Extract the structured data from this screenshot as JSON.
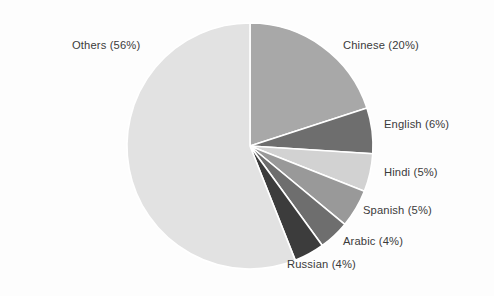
{
  "chart_data": {
    "type": "pie",
    "title": "",
    "subtitle": "",
    "xlabel": "",
    "ylabel": "",
    "grid": false,
    "legend_position": "none",
    "label_format": "{name} ({value}%)",
    "background_color": "#fdfdfd",
    "separator_color": "#ffffff",
    "label_text_color": "#3b3b3b",
    "center": {
      "x": 250,
      "y": 146
    },
    "radius": 123,
    "start_angle_deg": 0,
    "direction": "clockwise",
    "categories": [
      "Chinese",
      "English",
      "Hindi",
      "Spanish",
      "Arabic",
      "Russian",
      "Others"
    ],
    "values": [
      20,
      6,
      5,
      5,
      4,
      4,
      56
    ],
    "unit": "%",
    "slices": [
      {
        "name": "Chinese",
        "value": 20,
        "label": "Chinese (20%)",
        "color": "#a8a8a8"
      },
      {
        "name": "English",
        "value": 6,
        "label": "English (6%)",
        "color": "#6e6e6e"
      },
      {
        "name": "Hindi",
        "value": 5,
        "label": "Hindi (5%)",
        "color": "#d2d2d2"
      },
      {
        "name": "Spanish",
        "value": 5,
        "label": "Spanish (5%)",
        "color": "#999999"
      },
      {
        "name": "Arabic",
        "value": 4,
        "label": "Arabic (4%)",
        "color": "#6e6e6e"
      },
      {
        "name": "Russian",
        "value": 4,
        "label": "Russian (4%)",
        "color": "#3c3c3c"
      },
      {
        "name": "Others",
        "value": 56,
        "label": "Others (56%)",
        "color": "#e2e2e2"
      }
    ]
  }
}
